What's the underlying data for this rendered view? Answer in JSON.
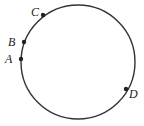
{
  "figure": {
    "stroke_color": "#333333",
    "circle": {
      "cx": 78,
      "cy": 62,
      "r": 57
    },
    "points": [
      {
        "label": "A",
        "x": 21,
        "y": 59,
        "lx": 5,
        "ly": 63
      },
      {
        "label": "B",
        "x": 24,
        "y": 42,
        "lx": 8,
        "ly": 46
      },
      {
        "label": "C",
        "x": 43,
        "y": 15,
        "lx": 31,
        "ly": 16
      },
      {
        "label": "D",
        "x": 126,
        "y": 89,
        "lx": 129,
        "ly": 98
      }
    ]
  }
}
